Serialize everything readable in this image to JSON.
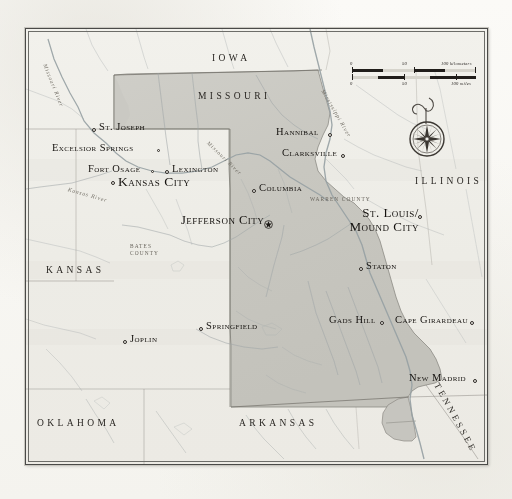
{
  "map": {
    "title_subject": "Missouri",
    "frame": {
      "border_color": "#4a4a48",
      "land_fill": "#efeee9",
      "state_fill": "#c9c8c2",
      "water_color": "#9aa3a6"
    },
    "state_labels": [
      {
        "name": "iowa",
        "text": "IOWA",
        "x": 186,
        "y": 24
      },
      {
        "name": "missouri",
        "text": "MISSOURI",
        "x": 172,
        "y": 62
      },
      {
        "name": "illinois",
        "text": "ILLINOIS",
        "x": 389,
        "y": 147
      },
      {
        "name": "kansas",
        "text": "KANSAS",
        "x": 20,
        "y": 236
      },
      {
        "name": "oklahoma",
        "text": "OKLAHOMA",
        "x": 11,
        "y": 389
      },
      {
        "name": "arkansas",
        "text": "ARKANSAS",
        "x": 213,
        "y": 389
      },
      {
        "name": "tennessee",
        "text": "TENNESSEE",
        "x": 418,
        "y": 372
      }
    ],
    "county_labels": [
      {
        "name": "bates-county",
        "line1": "BATES",
        "line2": "COUNTY",
        "x": 104,
        "y": 214
      },
      {
        "name": "warren-county",
        "line1": "WARREN COUNTY",
        "line2": "",
        "x": 284,
        "y": 167
      }
    ],
    "river_labels": [
      {
        "name": "missouri-river-west",
        "text": "Missouri River",
        "x": 19,
        "y": 32,
        "rotate": 68
      },
      {
        "name": "kansas-river",
        "text": "Kansas River",
        "x": 42,
        "y": 157,
        "rotate": 16
      },
      {
        "name": "missouri-river-central",
        "text": "Missouri River",
        "x": 182,
        "y": 110,
        "rotate": 44
      },
      {
        "name": "mississippi-river",
        "text": "Mississippi River",
        "x": 297,
        "y": 58,
        "rotate": 60
      }
    ],
    "cities": [
      {
        "name": "st-joseph",
        "label": "St. Joseph",
        "x": 73,
        "y": 96,
        "size": "normal",
        "dot": "left",
        "dot_x": 66,
        "dot_y": 99
      },
      {
        "name": "excelsior-springs",
        "label": "Excelsior Springs",
        "x": 26,
        "y": 117,
        "size": "normal",
        "dot": "right",
        "dot_x": 131,
        "dot_y": 120
      },
      {
        "name": "fort-osage",
        "label": "Fort Osage",
        "x": 62,
        "y": 139,
        "size": "normal",
        "dot": "right",
        "dot_x": 125,
        "dot_y": 141
      },
      {
        "name": "lexington",
        "label": "Lexington",
        "x": 146,
        "y": 139,
        "size": "normal",
        "dot": "left",
        "dot_x": 139,
        "dot_y": 141
      },
      {
        "name": "kansas-city",
        "label": "Kansas City",
        "x": 94,
        "y": 150,
        "size": "major",
        "dot": "left",
        "dot_x": 85,
        "dot_y": 152
      },
      {
        "name": "columbia",
        "label": "Columbia",
        "x": 233,
        "y": 158,
        "size": "normal",
        "dot": "left",
        "dot_x": 226,
        "dot_y": 160
      },
      {
        "name": "jefferson-city",
        "label": "Jefferson City",
        "x": 155,
        "y": 190,
        "size": "capital",
        "dot": "capital",
        "dot_x": 240,
        "dot_y": 191
      },
      {
        "name": "hannibal",
        "label": "Hannibal",
        "x": 250,
        "y": 101,
        "size": "normal",
        "dot": "right",
        "dot_x": 302,
        "dot_y": 104
      },
      {
        "name": "clarksville",
        "label": "Clarksville",
        "x": 256,
        "y": 122,
        "size": "normal",
        "dot": "right",
        "dot_x": 315,
        "dot_y": 125
      },
      {
        "name": "staton",
        "label": "Staton",
        "x": 340,
        "y": 236,
        "size": "normal",
        "dot": "left",
        "dot_x": 333,
        "dot_y": 238
      },
      {
        "name": "gads-hill",
        "label": "Gads Hill",
        "x": 303,
        "y": 290,
        "size": "normal",
        "dot": "right",
        "dot_x": 354,
        "dot_y": 292
      },
      {
        "name": "cape-girardeau",
        "label": "Cape Girardeau",
        "x": 369,
        "y": 290,
        "size": "normal",
        "dot": "right",
        "dot_x": 444,
        "dot_y": 292
      },
      {
        "name": "springfield",
        "label": "Springfield",
        "x": 180,
        "y": 296,
        "size": "normal",
        "dot": "left",
        "dot_x": 173,
        "dot_y": 298
      },
      {
        "name": "joplin",
        "label": "Joplin",
        "x": 104,
        "y": 309,
        "size": "normal",
        "dot": "left",
        "dot_x": 97,
        "dot_y": 311
      },
      {
        "name": "new-madrid",
        "label": "New Madrid",
        "x": 383,
        "y": 348,
        "size": "normal",
        "dot": "right",
        "dot_x": 447,
        "dot_y": 350
      }
    ],
    "st_louis": {
      "name": "st-louis-mound-city",
      "line1": "St. Louis/",
      "line2": "Mound City",
      "x": 303,
      "y": 180,
      "dot_x": 392,
      "dot_y": 186
    },
    "scalebar": {
      "km_labels": [
        "0",
        "50",
        "100 kilometers"
      ],
      "mi_labels": [
        "0",
        "50",
        "100 miles"
      ]
    },
    "compass": {
      "name": "compass-rose",
      "north_letter": "N"
    }
  }
}
